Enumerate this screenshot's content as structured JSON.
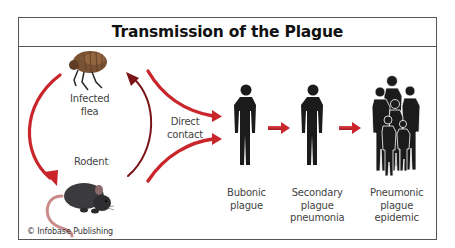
{
  "title": "Transmission of the Plague",
  "labels": {
    "flea": [
      "Infected",
      "flea"
    ],
    "rodent": "Rodent",
    "direct_contact": [
      "Direct",
      "contact"
    ],
    "bubonic": [
      "Bubonic",
      "plague"
    ],
    "secondary": [
      "Secondary",
      "plague",
      "pneumonia"
    ],
    "pneumonic": [
      "Pneumonic",
      "plague",
      "epidemic"
    ]
  },
  "credit": "© Infobase Publishing",
  "colors": {
    "arrow_red": "#c8262b",
    "arrow_dark": "#7a1418",
    "silhouette": "#1b1b1b",
    "flea_brown": "#7a5234",
    "rat_gray": "#3b3b3d",
    "rat_tail": "#c98a8a",
    "border": "#555555"
  },
  "icons": [
    "flea-icon",
    "rat-icon",
    "human-silhouette-icon",
    "crowd-silhouette-icon",
    "curved-arrow-icon",
    "right-arrow-icon"
  ]
}
